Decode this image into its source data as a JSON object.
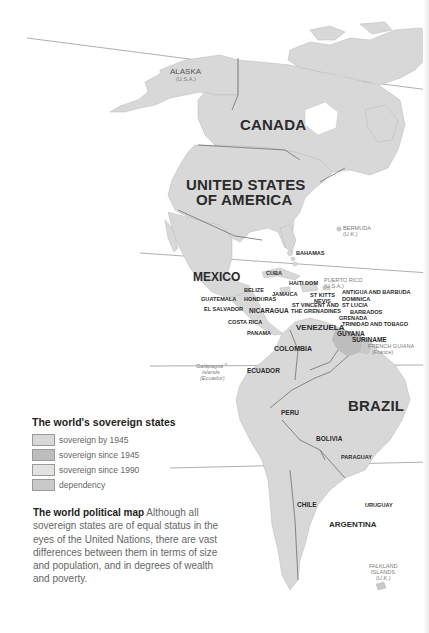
{
  "map": {
    "colors": {
      "sovereign_by_1945": "#d8d8d8",
      "sovereign_since_1945": "#bdbdbd",
      "sovereign_since_1990": "#e2e2e2",
      "dependency": "#c9c9c9",
      "borders": "#6e6e6e",
      "ocean": "#ffffff"
    },
    "labels": {
      "alaska": "ALASKA",
      "alaska_sub": "(U.S.A.)",
      "canada": "CANADA",
      "usa_line1": "UNITED STATES",
      "usa_line2": "OF AMERICA",
      "bermuda": "BERMUDA",
      "bermuda_sub": "(U.K.)",
      "bahamas": "BAHAMAS",
      "mexico": "MEXICO",
      "cuba": "CUBA",
      "haiti": "HAITI",
      "dom": "DOM",
      "puerto_rico": "PUERTO RICO",
      "puerto_rico_sub": "(U.S.A.)",
      "antigua": "ANTIGUA AND BARBUDA",
      "belize": "BELIZE",
      "jamaica": "JAMAICA",
      "st_kitts": "ST KITTS",
      "nevis": "NEVIS",
      "dominica": "DOMINICA",
      "guatemala": "GUATEMALA",
      "honduras": "HONDURAS",
      "st_vincent1": "ST VINCENT AND",
      "st_vincent2": "THE GRENADINES",
      "st_lucia": "ST LUCIA",
      "el_salvador": "EL SALVADOR",
      "nicaragua": "NICARAGUA",
      "barbados": "BARBADOS",
      "grenada": "GRENADA",
      "costa_rica": "COSTA RICA",
      "trinidad": "TRINIDAD AND TOBAGO",
      "venezuela": "VENEZUELA",
      "panama": "PANAMA",
      "guyana": "GUYANA",
      "suriname": "SURINAME",
      "french_guiana": "FRENCH GUIANA",
      "french_guiana_sub": "(France)",
      "colombia": "COLOMBIA",
      "galapagos1": "Galápagos",
      "galapagos2": "Islands",
      "galapagos3": "(Ecuador)",
      "ecuador": "ECUADOR",
      "brazil": "BRAZIL",
      "peru": "PERU",
      "bolivia": "BOLIVIA",
      "paraguay": "PARAGUAY",
      "chile": "CHILE",
      "uruguay": "URUGUAY",
      "argentina": "ARGENTINA",
      "falkland1": "FALKLAND",
      "falkland2": "ISLANDS",
      "falkland3": "(U.K.)"
    }
  },
  "legend": {
    "title": "The world's sovereign states",
    "items": [
      {
        "label": "sovereign by 1945",
        "color": "#d8d8d8"
      },
      {
        "label": "sovereign since 1945",
        "color": "#bdbdbd"
      },
      {
        "label": "sovereign since 1990",
        "color": "#e2e2e2"
      },
      {
        "label": "dependency",
        "color": "#c9c9c9"
      }
    ]
  },
  "caption": {
    "title": "The world political map",
    "body": " Although all sovereign states are of equal status in the eyes of the United Nations, there are vast differences between them in terms of size and population, and in degrees of wealth and poverty."
  }
}
